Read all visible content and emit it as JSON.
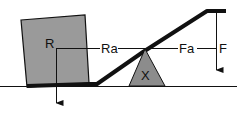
{
  "diagram": {
    "type": "lever",
    "labels": {
      "load_force": "R",
      "load_arm": "Ra",
      "effort_arm": "Fa",
      "effort_force": "F",
      "fulcrum": "X"
    },
    "colors": {
      "box_fill": "#9a9a9a",
      "fulcrum_fill": "#8c8c8c",
      "stroke": "#111111",
      "background": "#ffffff"
    }
  }
}
